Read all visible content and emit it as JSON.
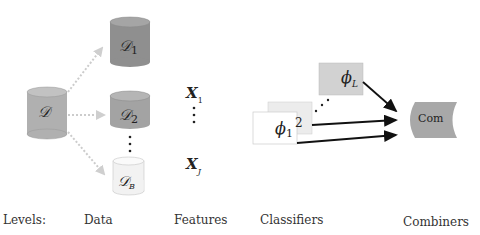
{
  "nodes": {
    "source": {
      "label": "𝒟",
      "fill": "#b0b0b0"
    },
    "d1": {
      "label": "𝒟",
      "sub": "1",
      "fill": "#8f8f8f"
    },
    "d2": {
      "label": "𝒟",
      "sub": "2",
      "fill": "#a3a3a3"
    },
    "dB": {
      "label": "𝒟",
      "sub": "B",
      "fill": "#f2f2f2"
    },
    "x1": {
      "label": "X",
      "sub": "1"
    },
    "xJ": {
      "label": "X",
      "sub": "J"
    },
    "phi1": {
      "label": "ϕ",
      "sub": "1",
      "fill": "#ffffff"
    },
    "phi2": {
      "label": "ϕ",
      "sub": "2",
      "fill": "#ececec"
    },
    "phiL": {
      "label": "ϕ",
      "sub": "L",
      "fill": "#d2d2d2"
    },
    "com": {
      "label": "Com",
      "fill": "#a8a8a8"
    }
  },
  "levels": {
    "title": "Levels:",
    "data": "Data",
    "features": "Features",
    "classifiers": "Classifiers",
    "combiners": "Combiners"
  }
}
